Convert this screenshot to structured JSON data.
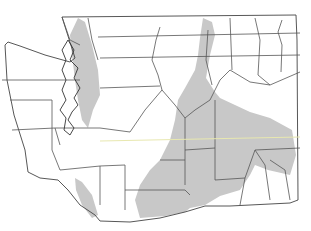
{
  "map": {
    "region": "Washington State",
    "type": "county distribution map",
    "colors": {
      "background": "#ffffff",
      "range_fill": "#c8c8c8",
      "county_stroke": "#555555"
    },
    "state_outline": "M62,17 L296,15 L297,40 L298,200 L290,203 L230,206 L205,206 L185,212 L160,218 L130,222 L100,221 L95,215 L80,205 L68,190 L58,180 L40,178 L28,172 L25,150 L14,115 L7,80 L5,45 L8,42 L20,46 L45,55 L70,62 L75,58 L62,17 Z",
    "counties": [
      "M62,17 L70,40 L80,45",
      "M88,18 L92,40 L98,60",
      "M98,37 L300,33",
      "M100,58 L300,55",
      "M2,80 L80,80",
      "M100,88 L160,86",
      "M10,100 L52,100 L52,150",
      "M12,130 L55,128 L60,145",
      "M55,128 L100,128 L130,132",
      "M52,150 L60,170",
      "M60,170 L100,166 L125,165",
      "M100,166 L100,205",
      "M125,165 L125,210",
      "M125,190 L185,190 L190,195",
      "M160,27 L156,40 L152,60 L158,75 L162,90 L145,110 L130,132",
      "M162,90 L175,105 L185,118 L195,110 L210,100 L220,80 L230,70 L250,82 L270,85 L300,72",
      "M208,30 L206,60 L212,85",
      "M230,18 L232,70",
      "M255,18 L260,40 L258,75 L270,85",
      "M282,20 L278,32 L282,45 L281,72",
      "M185,118 L185,185",
      "M185,150 L215,148 L215,100",
      "M215,148 L215,180 L245,178 L255,150",
      "M245,178 L240,205",
      "M255,150 L300,148",
      "M255,150 L265,165 L270,200",
      "M270,160 L285,170 L290,200",
      "M160,160 L185,160"
    ],
    "range_areas": [
      "M203,18 L212,22 L215,35 L210,55 L206,78 L215,92 L220,98 L250,112 L270,118 L292,130 L296,155 L290,175 L268,170 L255,165 L250,175 L240,190 L220,196 L205,205 L190,208 L185,212 L165,216 L140,218 L135,200 L140,185 L150,170 L160,160 L170,140 L175,120 L178,100 L185,88 L195,70 L198,55 L200,38 Z",
      "M78,18 L85,22 L92,45 L98,70 L100,95 L93,110 L88,128 L82,120 L78,100 L75,80 L72,55 L70,35 Z",
      "M75,178 L82,182 L92,195 L98,215 L92,218 L82,205 L76,190 Z"
    ],
    "puget_sound": "M68,40 L74,50 L70,60 L78,68 L74,78 L80,88 L74,98 L78,105 L72,112 L68,120 L74,128 L70,135 L64,130 L66,118 L60,110 L66,100 L62,90 L66,80 L62,70 L66,60 L62,50 Z",
    "highlight_line": "M100,141 L300,137"
  }
}
